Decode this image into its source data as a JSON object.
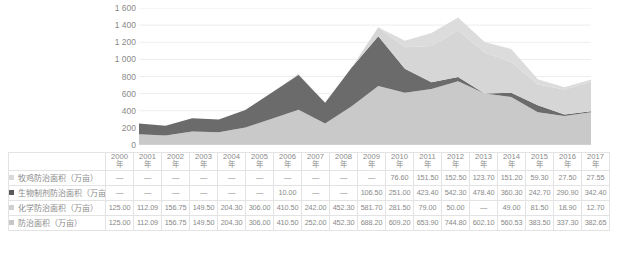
{
  "chart_data": {
    "type": "area",
    "title": "",
    "xlabel": "",
    "ylabel": "",
    "stacked": true,
    "grid": true,
    "legend_position": "left-table",
    "ylim": [
      0,
      1600
    ],
    "ytick_step": 200,
    "ytick_labels": [
      "1 600",
      "1 400",
      "1 200",
      "1 000",
      "800",
      "600",
      "400",
      "200",
      "0"
    ],
    "ytick_values": [
      1600,
      1400,
      1200,
      1000,
      800,
      600,
      400,
      200,
      0
    ],
    "categories": [
      "2000年",
      "2001年",
      "2002年",
      "2003年",
      "2004年",
      "2005年",
      "2006年",
      "2007年",
      "2008年",
      "2009年",
      "2010年",
      "2011年",
      "2012年",
      "2013年",
      "2014年",
      "2015年",
      "2016年",
      "2017年"
    ],
    "series": [
      {
        "name": "牧鸡防治面积（万亩）",
        "color": "#d9d9d9",
        "values": [
          null,
          null,
          null,
          null,
          null,
          null,
          null,
          null,
          null,
          null,
          76.6,
          151.5,
          152.5,
          123.7,
          151.2,
          59.3,
          27.5,
          27.55
        ],
        "display": [
          "—",
          "—",
          "—",
          "—",
          "—",
          "—",
          "—",
          "—",
          "—",
          "—",
          "76.60",
          "151.50",
          "152.50",
          "123.70",
          "151.20",
          "59.30",
          "27.50",
          "27.55"
        ]
      },
      {
        "name": "生物制剂防治面积（万亩）",
        "color": "#616161",
        "values": [
          null,
          null,
          null,
          null,
          null,
          null,
          10.0,
          null,
          null,
          106.5,
          251.0,
          423.4,
          542.3,
          478.4,
          360.3,
          242.7,
          290.9,
          342.4
        ],
        "display": [
          "—",
          "—",
          "—",
          "—",
          "—",
          "—",
          "10.00",
          "—",
          "—",
          "106.50",
          "251.00",
          "423.40",
          "542.30",
          "478.40",
          "360.30",
          "242.70",
          "290.90",
          "342.40"
        ]
      },
      {
        "name": "化学防治面积（万亩）",
        "color": "#cfcfcf",
        "values": [
          125.0,
          112.09,
          156.75,
          149.5,
          204.3,
          306.0,
          410.5,
          242.0,
          452.3,
          581.7,
          281.5,
          79.0,
          50.0,
          null,
          49.0,
          81.5,
          18.9,
          12.7
        ],
        "display": [
          "125.00",
          "112.09",
          "156.75",
          "149.50",
          "204.30",
          "306.00",
          "410.50",
          "242.00",
          "452.30",
          "581.70",
          "281.50",
          "79.00",
          "50.00",
          "—",
          "49.00",
          "81.50",
          "18.90",
          "12.70"
        ]
      },
      {
        "name": "防治面积（万亩）",
        "color": "#c2c2c2",
        "values": [
          125.0,
          112.09,
          156.75,
          149.5,
          204.3,
          306.0,
          410.5,
          252.0,
          452.3,
          688.2,
          609.2,
          653.9,
          744.8,
          602.1,
          560.53,
          383.5,
          337.3,
          382.65
        ],
        "display": [
          "125.00",
          "112.09",
          "156.75",
          "149.50",
          "204.30",
          "306.00",
          "410.50",
          "252.00",
          "452.30",
          "688.20",
          "609.20",
          "653.90",
          "744.80",
          "602.10",
          "560.53",
          "383.50",
          "337.30",
          "382.65"
        ]
      }
    ],
    "plot_bands": [
      {
        "name": "防治面积（万亩）",
        "color": "#c9c9c9",
        "values": [
          125.0,
          112.09,
          156.75,
          149.5,
          204.3,
          306.0,
          410.5,
          252.0,
          452.3,
          688.2,
          609.2,
          653.9,
          744.8,
          602.1,
          560.53,
          383.5,
          337.3,
          382.65
        ]
      },
      {
        "name": "化学防治面积（万亩）",
        "color": "#6b6b6b",
        "values": [
          125.0,
          112.09,
          156.75,
          149.5,
          204.3,
          306.0,
          410.5,
          242.0,
          452.3,
          581.7,
          281.5,
          79.0,
          50.0,
          0,
          49.0,
          81.5,
          18.9,
          12.7
        ]
      },
      {
        "name": "牧鸡防治面积（万亩）",
        "color": "#d6d6d6",
        "values": [
          0,
          0,
          0,
          0,
          0,
          0,
          0,
          0,
          0,
          106.5,
          251.0,
          423.4,
          542.3,
          478.4,
          360.3,
          242.7,
          290.9,
          342.4
        ]
      },
      {
        "name": "生物制剂防治面积（万亩）",
        "color": "#dcdcdc",
        "values": [
          0,
          0,
          0,
          0,
          0,
          0,
          10.0,
          0,
          0,
          0,
          76.6,
          151.5,
          152.5,
          123.7,
          151.2,
          59.3,
          27.5,
          27.55
        ]
      }
    ]
  },
  "table": {
    "row_header_label": "",
    "columns": [
      "2000年",
      "2001年",
      "2002年",
      "2003年",
      "2004年",
      "2005年",
      "2006年",
      "2007年",
      "2008年",
      "2009年",
      "2010年",
      "2011年",
      "2012年",
      "2013年",
      "2014年",
      "2015年",
      "2016年",
      "2017年"
    ],
    "rows": [
      {
        "label": "牧鸡防治面积（万亩）",
        "swatch_color": "#d9d9d9",
        "values": [
          "—",
          "—",
          "—",
          "—",
          "—",
          "—",
          "—",
          "—",
          "—",
          "—",
          "76.60",
          "151.50",
          "152.50",
          "123.70",
          "151.20",
          "59.30",
          "27.50",
          "27.55"
        ]
      },
      {
        "label": "生物制剂防治面积（万亩）",
        "swatch_color": "#5a5a5a",
        "values": [
          "—",
          "—",
          "—",
          "—",
          "—",
          "—",
          "10.00",
          "—",
          "—",
          "106.50",
          "251.00",
          "423.40",
          "542.30",
          "478.40",
          "360.30",
          "242.70",
          "290.90",
          "342.40"
        ]
      },
      {
        "label": "化学防治面积（万亩）",
        "swatch_color": "#d0d0d0",
        "values": [
          "125.00",
          "112.09",
          "156.75",
          "149.50",
          "204.30",
          "306.00",
          "410.50",
          "242.00",
          "452.30",
          "581.70",
          "281.50",
          "79.00",
          "50.00",
          "—",
          "49.00",
          "81.50",
          "18.90",
          "12.70"
        ]
      },
      {
        "label": "防治面积（万亩）",
        "swatch_color": "#c6c6c6",
        "values": [
          "125.00",
          "112.09",
          "156.75",
          "149.50",
          "204.30",
          "306.00",
          "410.50",
          "252.00",
          "452.30",
          "688.20",
          "609.20",
          "653.90",
          "744.80",
          "602.10",
          "560.53",
          "383.50",
          "337.30",
          "382.65"
        ]
      }
    ]
  },
  "style": {
    "grid_color": "#ededed",
    "text_color": "#8a8a8a",
    "border_color": "#e3e3e3",
    "background": "#ffffff"
  }
}
